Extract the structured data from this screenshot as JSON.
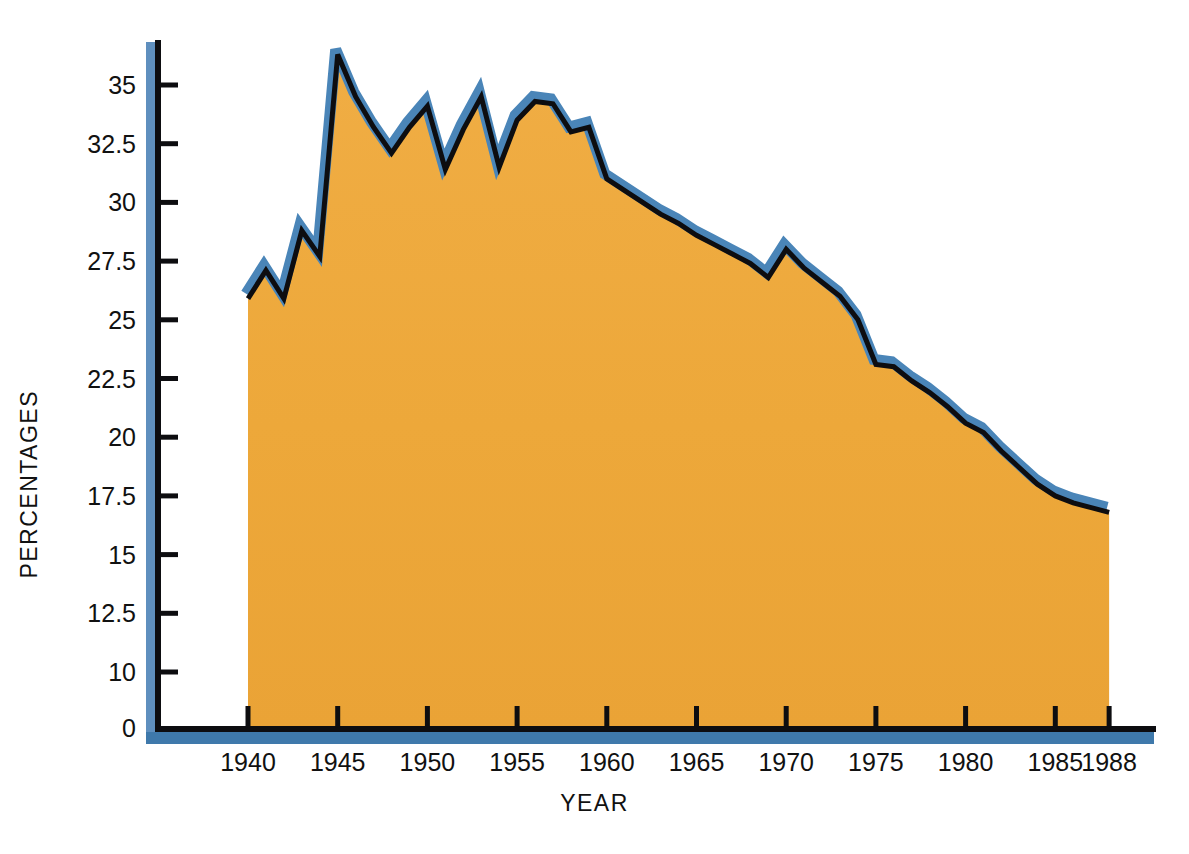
{
  "chart_data": {
    "type": "area",
    "title": "",
    "xlabel": "YEAR",
    "ylabel": "PERCENTAGES",
    "xlim": [
      1936,
      1990
    ],
    "ylim": [
      0,
      36.8
    ],
    "grid": false,
    "legend": null,
    "axis_break": "y-axis jumps from 0 directly to 10 (values 2.5, 5, 7.5 omitted)",
    "xticks": [
      1940,
      1945,
      1950,
      1955,
      1960,
      1965,
      1970,
      1975,
      1980,
      1985,
      1988
    ],
    "xtick_labels": [
      "1940",
      "1945",
      "1950",
      "1955",
      "1960",
      "1965",
      "1970",
      "1975",
      "1980",
      "1985",
      "1988"
    ],
    "yticks": [
      0,
      10,
      12.5,
      15,
      17.5,
      20,
      22.5,
      25,
      27.5,
      30,
      32.5,
      35
    ],
    "ytick_labels": [
      "0",
      "10",
      "12.5",
      "15",
      "17.5",
      "20",
      "22.5",
      "25",
      "27.5",
      "30",
      "32.5",
      "35"
    ],
    "colors": {
      "area_fill": "#eda83a",
      "line_shadow": "#0d0d10",
      "line_highlight": "#4a85b8",
      "axis": "#0d0d10",
      "axis_shadow": "#5f8fbe",
      "background": "#ffffff",
      "text": "#111111"
    },
    "x": [
      1940,
      1941,
      1942,
      1943,
      1944,
      1945,
      1946,
      1947,
      1948,
      1949,
      1950,
      1951,
      1952,
      1953,
      1954,
      1955,
      1956,
      1957,
      1958,
      1959,
      1960,
      1961,
      1962,
      1963,
      1964,
      1965,
      1966,
      1967,
      1968,
      1969,
      1970,
      1971,
      1972,
      1973,
      1974,
      1975,
      1976,
      1977,
      1978,
      1979,
      1980,
      1981,
      1982,
      1983,
      1984,
      1985,
      1986,
      1987,
      1988
    ],
    "values": [
      25.9,
      27.1,
      25.9,
      28.8,
      27.7,
      36.3,
      34.5,
      33.2,
      32.1,
      33.2,
      34.1,
      31.4,
      33.1,
      34.5,
      31.5,
      33.5,
      34.3,
      34.2,
      33.0,
      33.2,
      31.0,
      30.5,
      30.0,
      29.5,
      29.1,
      28.6,
      28.2,
      27.8,
      27.4,
      26.8,
      28.0,
      27.2,
      26.6,
      26.0,
      25.0,
      23.1,
      23.0,
      22.4,
      21.9,
      21.3,
      20.6,
      20.2,
      19.4,
      18.7,
      18.0,
      17.5,
      17.2,
      17.0,
      16.8
    ],
    "series_note": "Single filled area series; orange fill beneath a black line with blue highlight band."
  },
  "axes": {
    "y_axis_title": "PERCENTAGES",
    "x_axis_title": "YEAR"
  }
}
